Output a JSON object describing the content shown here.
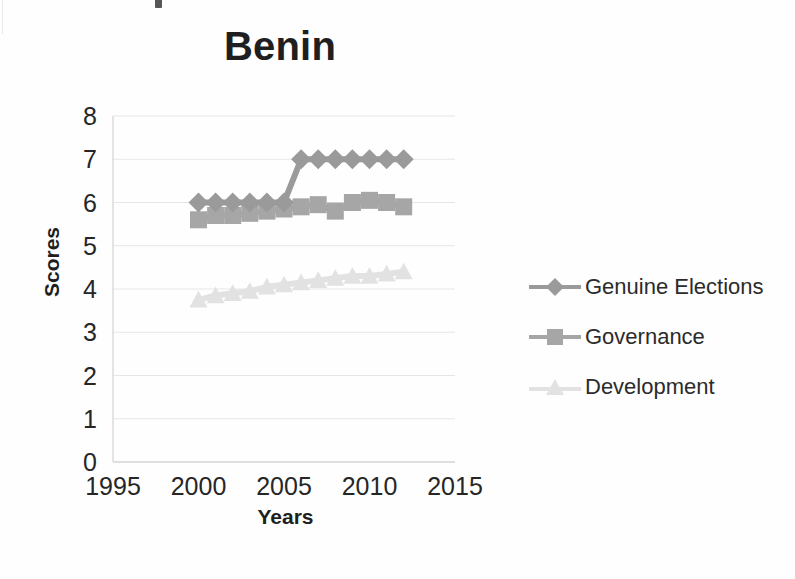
{
  "page": {
    "background_color": "#fefefe"
  },
  "chart_data": {
    "type": "line",
    "title": "Benin",
    "xlabel": "Years",
    "ylabel": "Scores",
    "xlim": [
      1995,
      2015
    ],
    "ylim": [
      0,
      8
    ],
    "grid": true,
    "legend_position": "right",
    "x_ticks": [
      "1995",
      "2000",
      "2005",
      "2010",
      "2015"
    ],
    "y_ticks": [
      "0",
      "1",
      "2",
      "3",
      "4",
      "5",
      "6",
      "7",
      "8"
    ],
    "x": [
      2000,
      2001,
      2002,
      2003,
      2004,
      2005,
      2006,
      2007,
      2008,
      2009,
      2010,
      2011,
      2012
    ],
    "series": [
      {
        "name": "Genuine Elections",
        "marker": "diamond",
        "color": "#9a9a9a",
        "values": [
          6,
          6,
          6,
          6,
          6,
          6,
          7,
          7,
          7,
          7,
          7,
          7,
          7
        ]
      },
      {
        "name": "Governance",
        "marker": "square",
        "color": "#a6a6a6",
        "values": [
          5.6,
          5.7,
          5.7,
          5.75,
          5.8,
          5.85,
          5.9,
          5.95,
          5.8,
          6.0,
          6.05,
          6.0,
          5.9
        ]
      },
      {
        "name": "Development",
        "marker": "triangle",
        "color": "#e2e2e2",
        "values": [
          3.75,
          3.85,
          3.9,
          3.95,
          4.05,
          4.1,
          4.15,
          4.2,
          4.25,
          4.3,
          4.3,
          4.35,
          4.4
        ]
      }
    ]
  },
  "legend": {
    "items": [
      {
        "label": "Genuine Elections",
        "marker": "diamond",
        "color": "#9a9a9a"
      },
      {
        "label": "Governance",
        "marker": "square",
        "color": "#a6a6a6"
      },
      {
        "label": "Development",
        "marker": "triangle",
        "color": "#e2e2e2"
      }
    ]
  },
  "colors": {
    "genuine_elections": "#9a9a9a",
    "governance": "#a6a6a6",
    "development": "#e2e2e2",
    "gridline": "#e6e6e6",
    "axis": "#d9d9d9",
    "text": "#262626"
  }
}
